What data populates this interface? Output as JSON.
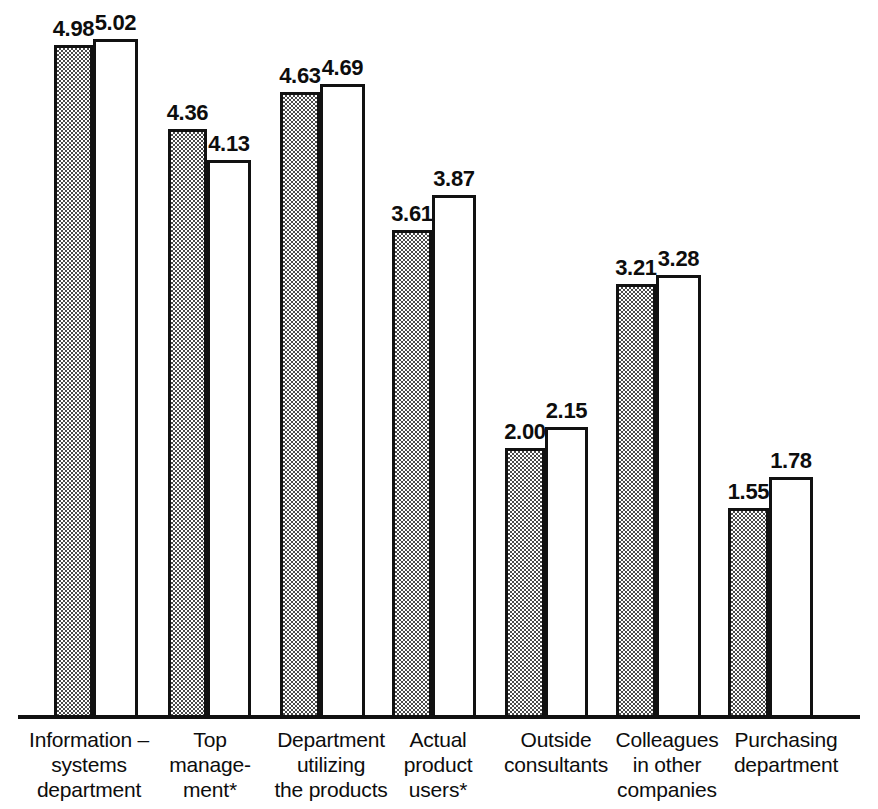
{
  "chart_data": {
    "type": "bar",
    "title": "",
    "subtitle": "",
    "xlabel": "",
    "ylabel": "",
    "ylim": [
      0,
      5.2
    ],
    "grid": false,
    "legend": "none",
    "value_format": "2-decimal",
    "categories": [
      "Information – systems department",
      "Top manage- ment*",
      "Department utilizing the products",
      "Actual product users*",
      "Outside consultants",
      "Colleagues in other companies",
      "Purchasing department"
    ],
    "series": [
      {
        "name": "shaded",
        "values": [
          4.98,
          4.36,
          4.63,
          3.61,
          2.0,
          3.21,
          1.55
        ]
      },
      {
        "name": "open",
        "values": [
          5.02,
          4.13,
          4.69,
          3.87,
          2.15,
          3.28,
          1.78
        ]
      }
    ]
  },
  "groups": [
    {
      "label_lines": [
        "Information –",
        "systems",
        "department"
      ],
      "shaded": {
        "value": "4.98",
        "height": 4.98
      },
      "open": {
        "value": "5.02",
        "height": 5.02
      }
    },
    {
      "label_lines": [
        "Top",
        "manage-",
        "ment*"
      ],
      "shaded": {
        "value": "4.36",
        "height": 4.36
      },
      "open": {
        "value": "4.13",
        "height": 4.13
      }
    },
    {
      "label_lines": [
        "Department",
        "utilizing",
        "the products"
      ],
      "shaded": {
        "value": "4.63",
        "height": 4.63
      },
      "open": {
        "value": "4.69",
        "height": 4.69
      }
    },
    {
      "label_lines": [
        "Actual",
        "product",
        "users*"
      ],
      "shaded": {
        "value": "3.61",
        "height": 3.61
      },
      "open": {
        "value": "3.87",
        "height": 3.87
      }
    },
    {
      "label_lines": [
        "Outside",
        "consultants"
      ],
      "shaded": {
        "value": "2.00",
        "height": 2.0
      },
      "open": {
        "value": "2.15",
        "height": 2.15
      }
    },
    {
      "label_lines": [
        "Colleagues",
        "in other",
        "companies"
      ],
      "shaded": {
        "value": "3.21",
        "height": 3.21
      },
      "open": {
        "value": "3.28",
        "height": 3.28
      }
    },
    {
      "label_lines": [
        "Purchasing",
        "department"
      ],
      "shaded": {
        "value": "1.55",
        "height": 1.55
      },
      "open": {
        "value": "1.78",
        "height": 1.78
      }
    }
  ],
  "colors": {
    "ink": "#111111",
    "background": "#ffffff",
    "shaded_fill": "#4a4a4a"
  }
}
